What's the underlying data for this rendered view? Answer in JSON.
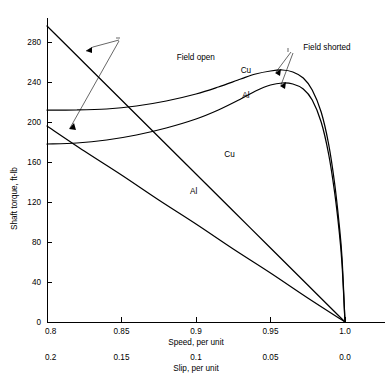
{
  "chart_data": {
    "type": "line",
    "title": "",
    "xlabel": "Speed, per unit",
    "xlabel_secondary": "Slip, per unit",
    "ylabel": "Shaft torque, ft-lb",
    "xlim": [
      0.8,
      1.0
    ],
    "ylim": [
      0,
      300
    ],
    "grid": false,
    "legend_position": "inline-annotations",
    "x_ticks": [
      "0.8",
      "0.85",
      "0.9",
      "0.95",
      "1.0"
    ],
    "x_tick_values": [
      0.8,
      0.85,
      0.9,
      0.95,
      1.0
    ],
    "x_ticks_secondary": [
      "0.2",
      "0.15",
      "0.1",
      "0.05",
      "0.0"
    ],
    "x_tick_values_secondary": [
      0.2,
      0.15,
      0.1,
      0.05,
      0.0
    ],
    "y_ticks": [
      "0",
      "40",
      "80",
      "120",
      "160",
      "200",
      "240",
      "280"
    ],
    "y_tick_values": [
      0,
      40,
      80,
      120,
      160,
      200,
      240,
      280
    ],
    "annotations": [
      {
        "text": "Field open",
        "x": 0.887,
        "y": 262
      },
      {
        "text": "Field shorted",
        "x": 0.972,
        "y": 272
      }
    ],
    "series": [
      {
        "name": "Cu, field open",
        "label": "Cu",
        "label_x": 0.9225,
        "label_y": 165,
        "condition": "field open",
        "material": "Cu",
        "points": [
          {
            "x": 0.8,
            "y": 296
          },
          {
            "x": 0.825,
            "y": 259
          },
          {
            "x": 0.85,
            "y": 222
          },
          {
            "x": 0.875,
            "y": 185
          },
          {
            "x": 0.9,
            "y": 148
          },
          {
            "x": 0.925,
            "y": 111
          },
          {
            "x": 0.95,
            "y": 74
          },
          {
            "x": 0.975,
            "y": 37
          },
          {
            "x": 1.0,
            "y": 0
          }
        ]
      },
      {
        "name": "Al, field open",
        "label": "Al",
        "label_x": 0.8985,
        "label_y": 128,
        "condition": "field open",
        "material": "Al",
        "points": [
          {
            "x": 0.8,
            "y": 196
          },
          {
            "x": 0.825,
            "y": 171
          },
          {
            "x": 0.85,
            "y": 147
          },
          {
            "x": 0.875,
            "y": 122
          },
          {
            "x": 0.9,
            "y": 98
          },
          {
            "x": 0.925,
            "y": 73
          },
          {
            "x": 0.95,
            "y": 49
          },
          {
            "x": 0.975,
            "y": 24
          },
          {
            "x": 1.0,
            "y": 0
          }
        ]
      },
      {
        "name": "Cu, field shorted",
        "label": "Cu",
        "label_x": 0.9335,
        "label_y": 249,
        "condition": "field shorted",
        "material": "Cu",
        "points": [
          {
            "x": 0.8,
            "y": 212
          },
          {
            "x": 0.82,
            "y": 212
          },
          {
            "x": 0.84,
            "y": 213
          },
          {
            "x": 0.86,
            "y": 216
          },
          {
            "x": 0.88,
            "y": 221
          },
          {
            "x": 0.9,
            "y": 228
          },
          {
            "x": 0.915,
            "y": 235
          },
          {
            "x": 0.93,
            "y": 243
          },
          {
            "x": 0.94,
            "y": 248
          },
          {
            "x": 0.95,
            "y": 251
          },
          {
            "x": 0.958,
            "y": 252
          },
          {
            "x": 0.965,
            "y": 250
          },
          {
            "x": 0.972,
            "y": 244
          },
          {
            "x": 0.978,
            "y": 232
          },
          {
            "x": 0.984,
            "y": 210
          },
          {
            "x": 0.989,
            "y": 178
          },
          {
            "x": 0.993,
            "y": 139
          },
          {
            "x": 0.996,
            "y": 99
          },
          {
            "x": 0.998,
            "y": 64
          },
          {
            "x": 1.0,
            "y": 0
          }
        ]
      },
      {
        "name": "Al, field shorted",
        "label": "Al",
        "label_x": 0.9335,
        "label_y": 224,
        "condition": "field shorted",
        "material": "Al",
        "points": [
          {
            "x": 0.8,
            "y": 178
          },
          {
            "x": 0.82,
            "y": 179
          },
          {
            "x": 0.84,
            "y": 182
          },
          {
            "x": 0.86,
            "y": 187
          },
          {
            "x": 0.88,
            "y": 194
          },
          {
            "x": 0.9,
            "y": 203
          },
          {
            "x": 0.915,
            "y": 212
          },
          {
            "x": 0.93,
            "y": 223
          },
          {
            "x": 0.94,
            "y": 231
          },
          {
            "x": 0.95,
            "y": 237
          },
          {
            "x": 0.958,
            "y": 239
          },
          {
            "x": 0.965,
            "y": 238
          },
          {
            "x": 0.972,
            "y": 233
          },
          {
            "x": 0.978,
            "y": 222
          },
          {
            "x": 0.984,
            "y": 200
          },
          {
            "x": 0.989,
            "y": 168
          },
          {
            "x": 0.993,
            "y": 130
          },
          {
            "x": 0.996,
            "y": 92
          },
          {
            "x": 0.998,
            "y": 58
          },
          {
            "x": 1.0,
            "y": 0
          }
        ]
      }
    ]
  }
}
